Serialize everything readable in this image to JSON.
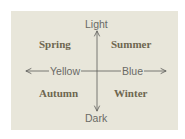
{
  "diagram": {
    "type": "quadrant-chart",
    "axes": {
      "vertical": {
        "top_label": "Light",
        "bottom_label": "Dark"
      },
      "horizontal": {
        "left_label": "Yellow",
        "right_label": "Blue"
      }
    },
    "quadrants": {
      "top_left": "Spring",
      "top_right": "Summer",
      "bottom_left": "Autumn",
      "bottom_right": "Winter"
    },
    "colors": {
      "panel_background": "#e8e6da",
      "axis_line": "#5a5a58",
      "axis_label": "#6a6a66",
      "season_label": "#6e6650"
    }
  }
}
